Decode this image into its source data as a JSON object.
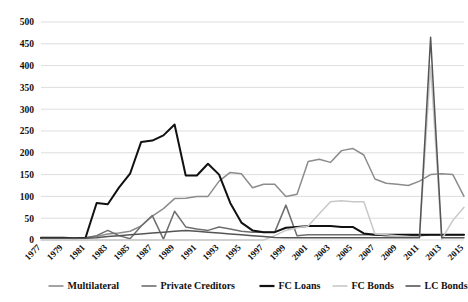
{
  "chart_data": {
    "type": "line",
    "title": "",
    "xlabel": "",
    "ylabel": "",
    "ylim": [
      0,
      500
    ],
    "ytick_values": [
      0,
      50,
      100,
      150,
      200,
      250,
      300,
      350,
      400,
      450,
      500
    ],
    "ytick_labels": [
      "0",
      "50",
      "100",
      "150",
      "200",
      "250",
      "300",
      "350",
      "400",
      "450",
      "500"
    ],
    "grid": true,
    "legend_position": "bottom",
    "x": [
      1977,
      1978,
      1979,
      1980,
      1981,
      1982,
      1983,
      1984,
      1985,
      1986,
      1987,
      1988,
      1989,
      1990,
      1991,
      1992,
      1993,
      1994,
      1995,
      1996,
      1997,
      1998,
      1999,
      2000,
      2001,
      2002,
      2003,
      2004,
      2005,
      2006,
      2007,
      2008,
      2009,
      2010,
      2011,
      2012,
      2013,
      2014,
      2015
    ],
    "xtick_labels": [
      "1977",
      "1979",
      "1981",
      "1983",
      "1985",
      "1987",
      "1989",
      "1991",
      "1993",
      "1995",
      "1997",
      "1999",
      "2001",
      "2003",
      "2005",
      "2007",
      "2009",
      "2011",
      "2013",
      "2015"
    ],
    "series": [
      {
        "name": "Multilateral",
        "color": "#8c8c8c",
        "width": 1.5,
        "values": [
          5,
          5,
          5,
          4,
          5,
          8,
          14,
          16,
          20,
          32,
          55,
          72,
          95,
          96,
          100,
          100,
          135,
          155,
          152,
          120,
          128,
          128,
          100,
          105,
          180,
          185,
          178,
          205,
          210,
          195,
          140,
          130,
          128,
          125,
          135,
          150,
          152,
          150,
          100
        ]
      },
      {
        "name": "Private Creditors",
        "color": "#6e6e6e",
        "width": 1.5,
        "values": [
          4,
          4,
          4,
          4,
          5,
          10,
          22,
          10,
          3,
          32,
          56,
          2,
          66,
          30,
          25,
          22,
          30,
          25,
          20,
          18,
          18,
          18,
          80,
          10,
          12,
          12,
          12,
          12,
          12,
          12,
          12,
          10,
          10,
          10,
          10,
          12,
          12,
          12,
          12
        ]
      },
      {
        "name": "FC Loans",
        "color": "#111111",
        "width": 2.0,
        "values": [
          5,
          5,
          5,
          4,
          5,
          85,
          82,
          120,
          152,
          225,
          228,
          240,
          265,
          148,
          148,
          175,
          150,
          85,
          40,
          22,
          18,
          18,
          28,
          30,
          32,
          32,
          32,
          30,
          30,
          15,
          12,
          12,
          12,
          12,
          12,
          12,
          12,
          12,
          12
        ]
      },
      {
        "name": "FC Bonds",
        "color": "#c8c8c8",
        "width": 1.5,
        "values": [
          0,
          0,
          0,
          0,
          0,
          0,
          0,
          0,
          0,
          0,
          0,
          0,
          0,
          0,
          0,
          0,
          0,
          0,
          0,
          0,
          0,
          10,
          22,
          28,
          32,
          60,
          88,
          90,
          88,
          88,
          14,
          12,
          10,
          8,
          6,
          400,
          2,
          45,
          75
        ]
      },
      {
        "name": "LC Bonds",
        "color": "#555555",
        "width": 1.5,
        "values": [
          4,
          4,
          4,
          4,
          4,
          5,
          8,
          10,
          12,
          14,
          16,
          18,
          20,
          22,
          20,
          18,
          16,
          14,
          12,
          10,
          8,
          6,
          5,
          5,
          5,
          5,
          5,
          5,
          5,
          5,
          5,
          5,
          5,
          5,
          5,
          465,
          5,
          5,
          5
        ]
      }
    ]
  },
  "legend": {
    "items": [
      {
        "label": "Multilateral",
        "color": "#8c8c8c"
      },
      {
        "label": "Private Creditors",
        "color": "#6e6e6e"
      },
      {
        "label": "FC Loans",
        "color": "#111111"
      },
      {
        "label": "FC Bonds",
        "color": "#c8c8c8"
      },
      {
        "label": "LC Bonds",
        "color": "#555555"
      }
    ]
  },
  "axes": {
    "grid_color": "#d0d0d0",
    "background": "#ffffff"
  }
}
